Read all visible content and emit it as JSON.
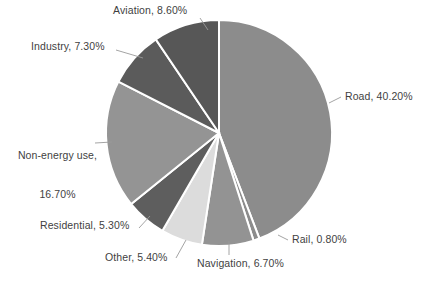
{
  "chart_data": {
    "type": "pie",
    "title": "",
    "subtitle": "",
    "xlabel": "",
    "ylabel": "",
    "legend_position": "none",
    "grid": false,
    "labels_show_percent": true,
    "start_angle_deg": 0,
    "direction": "clockwise",
    "categories": [
      "Road",
      "Rail",
      "Navigation",
      "Other",
      "Residential",
      "Non-energy use",
      "Industry",
      "Aviation"
    ],
    "values": [
      40.2,
      0.8,
      6.7,
      5.4,
      5.3,
      16.7,
      7.3,
      8.6
    ],
    "units": "%",
    "slices": [
      {
        "name": "Road",
        "value": 40.2,
        "label": "Road, 40.20%",
        "color": "#8c8c8c"
      },
      {
        "name": "Rail",
        "value": 0.8,
        "label": "Rail, 0.80%",
        "color": "#8c8c8c"
      },
      {
        "name": "Navigation",
        "value": 6.7,
        "label": "Navigation, 6.70%",
        "color": "#939393"
      },
      {
        "name": "Other",
        "value": 5.4,
        "label": "Other, 5.40%",
        "color": "#dcdcdc"
      },
      {
        "name": "Residential",
        "value": 5.3,
        "label": "Residential, 5.30%",
        "color": "#5e5e5e"
      },
      {
        "name": "Non-energy use",
        "value": 16.7,
        "label_line1": "Non-energy use,",
        "label_line2": "16.70%",
        "color": "#949494"
      },
      {
        "name": "Industry",
        "value": 7.3,
        "label": "Industry, 7.30%",
        "color": "#5b5b5b"
      },
      {
        "name": "Aviation",
        "value": 8.6,
        "label": "Aviation, 8.60%",
        "color": "#575757"
      }
    ],
    "geometry": {
      "center_x": 219,
      "center_y": 133,
      "radius": 113,
      "separator_color": "#ffffff",
      "separator_width": 2
    },
    "colors": {
      "background": "#ffffff",
      "label_text": "#3f3f3f",
      "leader_line": "#9a9a9a"
    }
  }
}
